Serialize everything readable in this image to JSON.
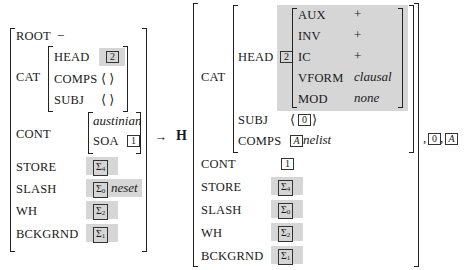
{
  "left_avm": {
    "root": {
      "feature": "ROOT",
      "value": "−"
    },
    "cat": {
      "feature": "CAT",
      "head": {
        "feature": "HEAD",
        "tag": "2"
      },
      "comps": {
        "feature": "COMPS",
        "value": "⟨ ⟩"
      },
      "subj": {
        "feature": "SUBJ",
        "value": "⟨ ⟩"
      }
    },
    "cont": {
      "feature": "CONT",
      "type": "austinian",
      "soa": {
        "feature": "SOA",
        "tag": "1"
      }
    },
    "store": {
      "feature": "STORE",
      "sigma": "Σ",
      "sub": "4"
    },
    "slash": {
      "feature": "SLASH",
      "sigma": "Σ",
      "sub": "0",
      "extra": "neset"
    },
    "wh": {
      "feature": "WH",
      "sigma": "Σ",
      "sub": "2"
    },
    "bckgrnd": {
      "feature": "BCKGRND",
      "sigma": "Σ",
      "sub": "1"
    }
  },
  "arrow": "→",
  "head_label": "H",
  "right_avm": {
    "cat": {
      "feature": "CAT",
      "head": {
        "feature": "HEAD",
        "tag": "2",
        "rows": [
          {
            "feature": "AUX",
            "value": "+"
          },
          {
            "feature": "INV",
            "value": "+"
          },
          {
            "feature": "IC",
            "value": "+"
          },
          {
            "feature": "VFORM",
            "value": "clausal"
          },
          {
            "feature": "MOD",
            "value": "none"
          }
        ]
      },
      "subj": {
        "feature": "SUBJ",
        "open": "⟨",
        "tag": "0",
        "close": "⟩"
      },
      "comps": {
        "feature": "COMPS",
        "tag": "A",
        "value": "nelist"
      }
    },
    "cont": {
      "feature": "CONT",
      "tag": "1"
    },
    "store": {
      "feature": "STORE",
      "sigma": "Σ",
      "sub": "4"
    },
    "slash": {
      "feature": "SLASH",
      "sigma": "Σ",
      "sub": "0"
    },
    "wh": {
      "feature": "WH",
      "sigma": "Σ",
      "sub": "2"
    },
    "bckgrnd": {
      "feature": "BCKGRND",
      "sigma": "Σ",
      "sub": "1"
    }
  },
  "daughters": {
    "sep1": ",",
    "tag1": "0",
    "sep2": ",",
    "tag2": "A"
  },
  "colors": {
    "shade": "#d6d6d6",
    "ink": "#1a1a1a"
  }
}
